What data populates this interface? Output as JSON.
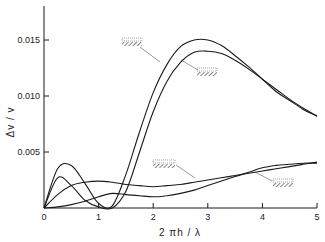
{
  "chart_data": {
    "type": "line",
    "title": "",
    "xlabel": "2 πh / λ",
    "ylabel": "Δv / v",
    "xlim": [
      0,
      5
    ],
    "ylim": [
      0,
      0.018
    ],
    "grid": false,
    "legend": "none (curves identified by hatched interface-symbol annotations)",
    "xticks": [
      "0",
      "1",
      "2",
      "3",
      "4",
      "5"
    ],
    "yticks": [
      "0.005",
      "0.010",
      "0.015"
    ],
    "x": [
      0,
      0.25,
      0.5,
      0.75,
      1.0,
      1.25,
      1.5,
      1.75,
      2.0,
      2.25,
      2.5,
      2.75,
      3.0,
      3.25,
      3.5,
      3.75,
      4.0,
      4.25,
      4.5,
      4.75,
      5.0
    ],
    "series": [
      {
        "name": "upper curve (annotation symbol A)",
        "values": [
          0,
          0.0035,
          0.0038,
          0.0022,
          0.0004,
          0.0002,
          0.003,
          0.0068,
          0.0103,
          0.0128,
          0.0144,
          0.015,
          0.015,
          0.0145,
          0.0136,
          0.0126,
          0.0115,
          0.0104,
          0.0096,
          0.0088,
          0.0082
        ]
      },
      {
        "name": "second curve (annotation symbol B)",
        "values": [
          0,
          0.0027,
          0.002,
          0.0007,
          0.0001,
          0.0,
          0.0015,
          0.005,
          0.0086,
          0.0113,
          0.013,
          0.0139,
          0.014,
          0.0138,
          0.0132,
          0.0124,
          0.0115,
          0.0106,
          0.0097,
          0.0089,
          0.0082
        ]
      },
      {
        "name": "low curve (annotation symbol C)",
        "values": [
          0,
          0.0012,
          0.002,
          0.0023,
          0.0024,
          0.0023,
          0.0021,
          0.002,
          0.0019,
          0.002,
          0.0021,
          0.0023,
          0.0025,
          0.0027,
          0.0029,
          0.0031,
          0.0033,
          0.0035,
          0.0037,
          0.0039,
          0.0041
        ]
      },
      {
        "name": "lowest curve (annotation symbol D)",
        "values": [
          0,
          0.0001,
          0.0003,
          0.0006,
          0.001,
          0.0013,
          0.0012,
          0.0011,
          0.001,
          0.0011,
          0.0013,
          0.0016,
          0.002,
          0.0024,
          0.0028,
          0.0032,
          0.0036,
          0.0038,
          0.0039,
          0.004,
          0.004
        ]
      }
    ],
    "annotations": [
      {
        "text": "hatched interface symbol",
        "points_to": "upper curve",
        "x": 1.8,
        "y": 0.0148
      },
      {
        "text": "hatched interface symbol",
        "points_to": "second curve",
        "x": 3.2,
        "y": 0.0125
      },
      {
        "text": "hatched interface symbol",
        "points_to": "low curve",
        "x": 3.0,
        "y": 0.004
      },
      {
        "text": "hatched interface symbol",
        "points_to": "lowest curve",
        "x": 4.3,
        "y": 0.0023
      }
    ]
  },
  "axes": {
    "xlabel": "2 πh / λ",
    "ylabel": "Δv / v",
    "xticks": [
      "0",
      "1",
      "2",
      "3",
      "4",
      "5"
    ],
    "yticks": [
      "0.005",
      "0.010",
      "0.015"
    ]
  }
}
